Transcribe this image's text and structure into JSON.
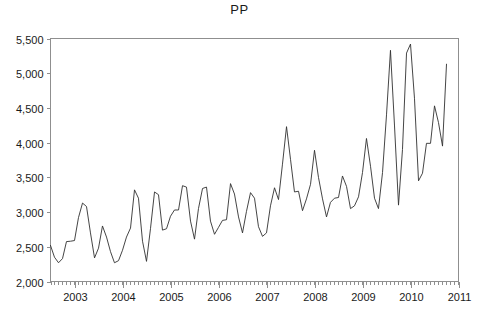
{
  "chart": {
    "title": "PP",
    "type_label": "line"
  },
  "axes": {
    "y_tick_labels": [
      "2,000",
      "2,500",
      "3,000",
      "3,500",
      "4,000",
      "4,500",
      "5,000",
      "5,500"
    ],
    "x_tick_labels": [
      "2003",
      "2004",
      "2005",
      "2006",
      "2007",
      "2008",
      "2009",
      "2010",
      "2011"
    ]
  },
  "colors": {
    "line": "#303030",
    "frame": "#8f8f8f",
    "text": "#1a1a1a",
    "background": "#ffffff"
  },
  "chart_data": {
    "type": "line",
    "title": "PP",
    "xlabel": "",
    "ylabel": "",
    "xlim": [
      2002.5,
      2011.0
    ],
    "ylim": [
      2000,
      5500
    ],
    "yticks": [
      2000,
      2500,
      3000,
      3500,
      4000,
      4500,
      5000,
      5500
    ],
    "ytick_labels": [
      "2,000",
      "2,500",
      "3,000",
      "3,500",
      "4,000",
      "4,500",
      "5,000",
      "5,500"
    ],
    "xticks": [
      2003,
      2004,
      2005,
      2006,
      2007,
      2008,
      2009,
      2010,
      2011
    ],
    "xtick_labels": [
      "2003",
      "2004",
      "2005",
      "2006",
      "2007",
      "2008",
      "2009",
      "2010",
      "2011"
    ],
    "x_minor_ticks": "monthly",
    "grid": false,
    "legend": false,
    "frequency": "monthly",
    "series": [
      {
        "name": "PP",
        "x": [
          2002.5,
          2002.583,
          2002.667,
          2002.75,
          2002.833,
          2002.917,
          2003.0,
          2003.083,
          2003.167,
          2003.25,
          2003.333,
          2003.417,
          2003.5,
          2003.583,
          2003.667,
          2003.75,
          2003.833,
          2003.917,
          2004.0,
          2004.083,
          2004.167,
          2004.25,
          2004.333,
          2004.417,
          2004.5,
          2004.583,
          2004.667,
          2004.75,
          2004.833,
          2004.917,
          2005.0,
          2005.083,
          2005.167,
          2005.25,
          2005.333,
          2005.417,
          2005.5,
          2005.583,
          2005.667,
          2005.75,
          2005.833,
          2005.917,
          2006.0,
          2006.083,
          2006.167,
          2006.25,
          2006.333,
          2006.417,
          2006.5,
          2006.583,
          2006.667,
          2006.75,
          2006.833,
          2006.917,
          2007.0,
          2007.083,
          2007.167,
          2007.25,
          2007.333,
          2007.417,
          2007.5,
          2007.583,
          2007.667,
          2007.75,
          2007.833,
          2007.917,
          2008.0,
          2008.083,
          2008.167,
          2008.25,
          2008.333,
          2008.417,
          2008.5,
          2008.583,
          2008.667,
          2008.75,
          2008.833,
          2008.917,
          2009.0,
          2009.083,
          2009.167,
          2009.25,
          2009.333,
          2009.417,
          2009.5,
          2009.583,
          2009.667,
          2009.75,
          2009.833,
          2009.917,
          2010.0,
          2010.083,
          2010.167,
          2010.25,
          2010.333,
          2010.417,
          2010.5
        ],
        "values": [
          2520,
          2350,
          2270,
          2330,
          2575,
          2580,
          2590,
          2920,
          3130,
          3080,
          2700,
          2340,
          2480,
          2800,
          2640,
          2430,
          2270,
          2300,
          2450,
          2640,
          2770,
          3320,
          3200,
          2580,
          2290,
          2760,
          3290,
          3250,
          2740,
          2760,
          2940,
          3030,
          3030,
          3380,
          3360,
          2870,
          2610,
          3050,
          3340,
          3360,
          2870,
          2680,
          2780,
          2880,
          2890,
          3410,
          3260,
          2930,
          2700,
          3010,
          3280,
          3200,
          2790,
          2650,
          2700,
          3090,
          3350,
          3180,
          3690,
          4230,
          3760,
          3290,
          3300,
          3020,
          3190,
          3400,
          3890,
          3500,
          3190,
          2930,
          3140,
          3200,
          3210,
          3520,
          3370,
          3050,
          3090,
          3220,
          3570,
          4060,
          3660,
          3200,
          3050,
          3570,
          4400,
          5330,
          4240,
          3100,
          3900,
          5290,
          5420,
          4640,
          3450,
          3560,
          3990,
          3990,
          4530
        ]
      }
    ],
    "series_extended_note": "",
    "notable_points": {
      "series_start": {
        "x": 2002.5,
        "y": 2520
      },
      "series_end": {
        "x": 2010.5,
        "y": 5130
      },
      "global_max": {
        "x": 2009.833,
        "y": 5420
      },
      "global_min": {
        "x": 2002.667,
        "y": 2270
      }
    }
  },
  "chart_data_tail": {
    "x": [
      2010.583,
      2010.667
    ],
    "values": [
      4290,
      3950
    ]
  },
  "chart_data_final": {
    "x": [
      2010.75
    ],
    "values": [
      5130
    ]
  }
}
